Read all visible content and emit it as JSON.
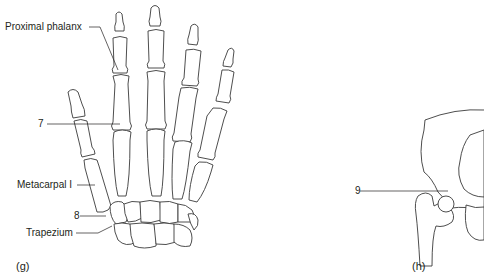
{
  "panels": {
    "g": {
      "caption": "(g)",
      "subject": "hand-skeleton",
      "labels": [
        {
          "id": "proximal-phalanx",
          "text": "Proximal phalanx"
        },
        {
          "id": "7",
          "text": "7"
        },
        {
          "id": "metacarpal-i",
          "text": "Metacarpal I"
        },
        {
          "id": "8",
          "text": "8"
        },
        {
          "id": "trapezium",
          "text": "Trapezium"
        }
      ]
    },
    "h": {
      "caption": "(h)",
      "subject": "hip-joint",
      "labels": [
        {
          "id": "9",
          "text": "9"
        }
      ]
    }
  },
  "colors": {
    "bone_fill": "#ffffff",
    "bone_outline": "#3a3a3a",
    "text": "#231f20"
  }
}
